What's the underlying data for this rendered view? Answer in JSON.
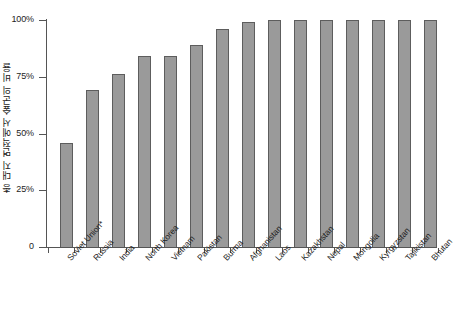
{
  "chart_data": {
    "type": "bar",
    "title": "",
    "xlabel": "",
    "ylabel": "총 대지 면적에서 숲군의 비율",
    "ylim": [
      0,
      100
    ],
    "yticks": [
      0,
      25,
      50,
      75,
      100
    ],
    "ytick_labels": [
      "0",
      "25%",
      "50%",
      "75%",
      "100%"
    ],
    "grid": false,
    "legend": "none",
    "bar_color": "#9a9a9a",
    "bar_edge_color": "#5d5d5d",
    "axis_color": "#555555",
    "background": "#ffffff",
    "categories": [
      "Soviet Union*",
      "Russia",
      "India",
      "North Korea",
      "Vietnam",
      "Pakistan",
      "Burma",
      "Afghanistan",
      "Laos",
      "Kazakhstan",
      "Nepal",
      "Mongolia",
      "Kyrgyzstan",
      "Tajikistan",
      "Bhutan"
    ],
    "values": [
      46,
      69,
      76,
      84,
      84,
      89,
      96,
      99,
      100,
      100,
      100,
      100.5,
      100.5,
      100.5,
      100.5
    ]
  }
}
